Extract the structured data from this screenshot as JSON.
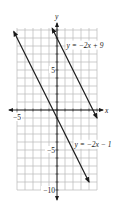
{
  "chart_data": {
    "type": "line",
    "title": "",
    "xlabel": "x",
    "ylabel": "y",
    "xlim": [
      -5,
      5
    ],
    "ylim": [
      -10,
      10
    ],
    "grid": true,
    "grid_step": 1,
    "x_tick_labels": [
      {
        "value": -5,
        "label": "−5"
      }
    ],
    "y_tick_labels": [
      {
        "value": 5,
        "label": "5"
      },
      {
        "value": -5,
        "label": "−5"
      },
      {
        "value": -10,
        "label": "−10"
      }
    ],
    "series": [
      {
        "name": "y = −2x + 9",
        "slope": -2,
        "intercept": 9,
        "x": [
          -0.6,
          5.0
        ],
        "y": [
          10.2,
          -1.0
        ],
        "label_pos": {
          "x": 1.2,
          "y": 7.8
        }
      },
      {
        "name": "y = −2x − 1",
        "slope": -2,
        "intercept": -1,
        "x": [
          -5.4,
          4.0
        ],
        "y": [
          9.8,
          -9.0
        ],
        "label_pos": {
          "x": 2.2,
          "y": -4.6
        }
      }
    ],
    "legend": "none (inline labels)",
    "colors": {
      "grid": "#b8b8b8",
      "axis": "#222222",
      "line": "#1a1a1a"
    }
  }
}
